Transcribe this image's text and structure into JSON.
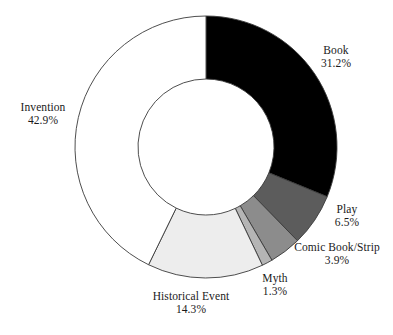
{
  "chart_data": {
    "type": "pie",
    "variant": "donut",
    "title": "",
    "subtitle": "",
    "xlabel": "",
    "ylabel": "",
    "legend_position": "none",
    "grid": false,
    "units": "percent",
    "start_angle_deg": 0,
    "direction": "clockwise",
    "center_px": [
      206,
      147
    ],
    "outer_radius_px": 131,
    "inner_radius_px": 68,
    "categories": [
      "Book",
      "Play",
      "Comic Book/Strip",
      "Myth",
      "Historical Event",
      "Invention"
    ],
    "values": [
      31.2,
      6.5,
      3.9,
      1.3,
      14.3,
      42.9
    ],
    "slices": [
      {
        "label": "Book",
        "value": 31.2,
        "value_text": "31.2%",
        "color": "#000000",
        "start_deg": 0.0,
        "end_deg": 112.3
      },
      {
        "label": "Play",
        "value": 6.5,
        "value_text": "6.5%",
        "color": "#5c5c5c",
        "start_deg": 112.3,
        "end_deg": 135.7
      },
      {
        "label": "Comic Book/Strip",
        "value": 3.9,
        "value_text": "3.9%",
        "color": "#8c8c8c",
        "start_deg": 135.7,
        "end_deg": 149.8
      },
      {
        "label": "Myth",
        "value": 1.3,
        "value_text": "1.3%",
        "color": "#b5b5b5",
        "start_deg": 149.8,
        "end_deg": 154.5
      },
      {
        "label": "Historical Event",
        "value": 14.3,
        "value_text": "14.3%",
        "color": "#ededed",
        "start_deg": 154.5,
        "end_deg": 206.0
      },
      {
        "label": "Invention",
        "value": 42.9,
        "value_text": "42.9%",
        "color": "#ffffff",
        "start_deg": 206.0,
        "end_deg": 360.0
      }
    ],
    "stroke_color": "#3a3a3a",
    "background_color": "#ffffff"
  },
  "labels": {
    "book": {
      "name": "Book",
      "value": "31.2%"
    },
    "play": {
      "name": "Play",
      "value": "6.5%"
    },
    "comic": {
      "name": "Comic Book/Strip",
      "value": "3.9%"
    },
    "myth": {
      "name": "Myth",
      "value": "1.3%"
    },
    "historical": {
      "name": "Historical Event",
      "value": "14.3%"
    },
    "invention": {
      "name": "Invention",
      "value": "42.9%"
    }
  }
}
